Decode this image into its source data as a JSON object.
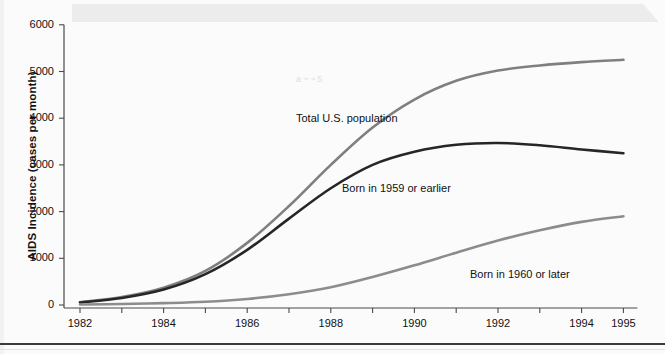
{
  "figure": {
    "background_color": "#fbfbfb",
    "ink_color": "#111111"
  },
  "chart_data": {
    "type": "line",
    "title": "",
    "subtitle": "",
    "xlabel": "",
    "ylabel": "AIDS Incidence (cases per month)",
    "xlim": [
      1982,
      1995
    ],
    "ylim": [
      0,
      6000
    ],
    "grid": false,
    "legend_position": "inline-annotations",
    "x_tick_labels": [
      "1982",
      "1984",
      "1986",
      "1988",
      "1990",
      "1992",
      "1994",
      "1995"
    ],
    "x_tick_values": [
      1982,
      1984,
      1986,
      1988,
      1990,
      1992,
      1994,
      1995
    ],
    "x_minor_ticks": [
      1983,
      1985,
      1987,
      1989,
      1991,
      1993
    ],
    "y_tick_labels": [
      "0",
      "1000",
      "2000",
      "3000",
      "4000",
      "5000",
      "6000"
    ],
    "y_tick_values": [
      0,
      1000,
      2000,
      3000,
      4000,
      5000,
      6000
    ],
    "x": [
      1982,
      1983,
      1984,
      1985,
      1986,
      1987,
      1988,
      1989,
      1990,
      1991,
      1992,
      1993,
      1994,
      1995
    ],
    "series": [
      {
        "name": "Total U.S. population",
        "color": "#7f7f7f",
        "line_width": 2.6,
        "values": [
          60,
          170,
          370,
          730,
          1330,
          2120,
          3000,
          3800,
          4400,
          4800,
          5020,
          5130,
          5200,
          5250
        ],
        "annotation": {
          "text": "Total U.S. population",
          "x_px": 296,
          "y_px": 112
        }
      },
      {
        "name": "Born in 1959 or earlier",
        "color": "#262626",
        "line_width": 2.6,
        "values": [
          55,
          150,
          330,
          660,
          1180,
          1850,
          2500,
          3000,
          3280,
          3430,
          3470,
          3420,
          3330,
          3250
        ],
        "annotation": {
          "text": "Born in 1959 or earlier",
          "x_px": 342,
          "y_px": 182
        }
      },
      {
        "name": "Born in 1960 or later",
        "color": "#8c8c8c",
        "line_width": 2.6,
        "values": [
          10,
          20,
          40,
          70,
          130,
          230,
          380,
          600,
          850,
          1120,
          1380,
          1600,
          1780,
          1900
        ],
        "annotation": {
          "text": "Born in 1960 or later",
          "x_px": 470,
          "y_px": 268
        }
      }
    ]
  },
  "axes": {
    "geometry": {
      "x_origin_px": 80,
      "y_zero_px": 305,
      "px_per_year": 41.8,
      "px_per_1000": 46.7,
      "axis_left_px": 64,
      "axis_bottom_px": 308
    }
  },
  "artifacts": {
    "faint_marks": [
      "a~~5"
    ]
  }
}
